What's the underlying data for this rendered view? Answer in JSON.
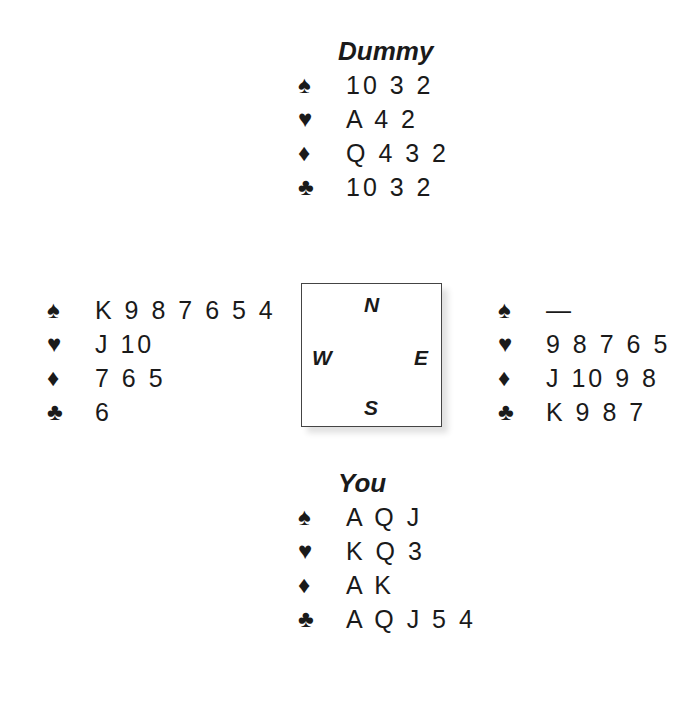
{
  "suit_symbols": {
    "spades": "♠",
    "hearts": "♥",
    "diamonds": "♦",
    "clubs": "♣"
  },
  "hands": {
    "north": {
      "label": "Dummy",
      "spades": "10 3 2",
      "hearts": "A 4 2",
      "diamonds": "Q 4 3 2",
      "clubs": "10 3 2"
    },
    "west": {
      "label": "",
      "spades": "K 9 8 7 6 5 4",
      "hearts": "J 10",
      "diamonds": "7 6 5",
      "clubs": "6"
    },
    "east": {
      "label": "",
      "spades": "—",
      "hearts": "9 8 7 6 5",
      "diamonds": "J 10 9 8",
      "clubs": "K 9 8 7"
    },
    "south": {
      "label": "You",
      "spades": "A Q J",
      "hearts": "K Q 3",
      "diamonds": "A K",
      "clubs": "A Q J 5 4"
    }
  },
  "compass": {
    "north": "N",
    "west": "W",
    "east": "E",
    "south": "S"
  }
}
